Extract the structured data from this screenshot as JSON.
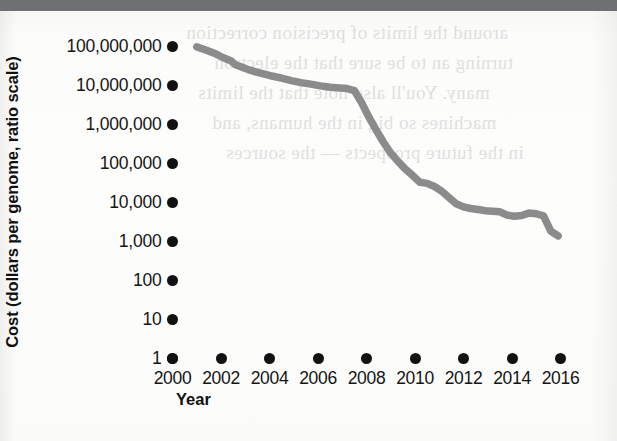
{
  "figure": {
    "y_axis_title": "Cost (dollars per genome, ratio scale)",
    "x_axis_title": "Year",
    "line_color": "#8a8b8a",
    "tick_color": "#111111",
    "background_color": "#fdfdfc",
    "top_band_color": "#6f7072"
  },
  "ghost_text": {
    "line1": "around the limits of precision correction",
    "line2": "turning an to be sure that the electron",
    "line3": "many. You'll also note that the limits",
    "line4": "machines so big in the humans, and",
    "line5": "in the future prospects — the sources"
  },
  "chart_data": {
    "type": "line",
    "title": "",
    "xlabel": "Year",
    "ylabel": "Cost (dollars per genome, ratio scale)",
    "y_scale": "log",
    "ylim": [
      1,
      100000000
    ],
    "xlim": [
      2000,
      2016
    ],
    "grid": false,
    "legend": false,
    "y_tick_labels": [
      "100,000,000",
      "10,000,000",
      "1,000,000",
      "100,000",
      "10,000",
      "1,000",
      "100",
      "10",
      "1"
    ],
    "y_tick_values": [
      100000000,
      10000000,
      1000000,
      100000,
      10000,
      1000,
      100,
      10,
      1
    ],
    "x_tick_labels": [
      "2000",
      "2002",
      "2004",
      "2006",
      "2008",
      "2010",
      "2012",
      "2014",
      "2016"
    ],
    "x_tick_values": [
      2000,
      2002,
      2004,
      2006,
      2008,
      2010,
      2012,
      2014,
      2016
    ],
    "series": [
      {
        "name": "Cost per genome",
        "x": [
          2001.0,
          2001.4,
          2001.8,
          2002.1,
          2002.4,
          2002.6,
          2002.9,
          2003.2,
          2003.5,
          2003.8,
          2004.1,
          2004.5,
          2004.9,
          2005.3,
          2005.7,
          2006.1,
          2006.5,
          2006.9,
          2007.2,
          2007.5,
          2007.8,
          2008.1,
          2008.4,
          2008.7,
          2009.0,
          2009.3,
          2009.6,
          2009.9,
          2010.2,
          2010.5,
          2010.8,
          2011.1,
          2011.4,
          2011.7,
          2012.0,
          2012.3,
          2012.6,
          2012.9,
          2013.2,
          2013.5,
          2013.8,
          2014.1,
          2014.4,
          2014.7,
          2015.0,
          2015.3,
          2015.6,
          2015.9
        ],
        "y": [
          95000000,
          78000000,
          62000000,
          50000000,
          42000000,
          33000000,
          28000000,
          24000000,
          21000000,
          19000000,
          17000000,
          15000000,
          13000000,
          11500000,
          10500000,
          9500000,
          8800000,
          8400000,
          8100000,
          7200000,
          3500000,
          1500000,
          700000,
          340000,
          180000,
          110000,
          70000,
          48000,
          32000,
          30000,
          25000,
          19000,
          13000,
          9000,
          7500,
          6800,
          6400,
          6000,
          5800,
          5600,
          4600,
          4300,
          4500,
          5200,
          5000,
          4400,
          1800,
          1350
        ]
      }
    ],
    "annotations": []
  }
}
